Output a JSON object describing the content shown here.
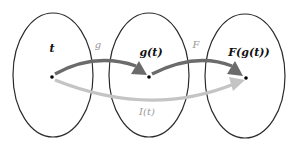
{
  "diagram": {
    "sets": [
      {
        "id": "domain",
        "cx": 53,
        "cy": 75,
        "rx": 40,
        "ry": 62
      },
      {
        "id": "middle",
        "cx": 149,
        "cy": 75,
        "rx": 40,
        "ry": 62
      },
      {
        "id": "codomain",
        "cx": 245,
        "cy": 76,
        "rx": 40,
        "ry": 62
      }
    ],
    "points": [
      {
        "label": "t",
        "x": 52,
        "y": 77
      },
      {
        "label": "g(t)",
        "x": 149,
        "y": 77
      },
      {
        "label": "F(g(t))",
        "x": 246,
        "y": 78
      }
    ],
    "labels": {
      "t": "t",
      "g_t": "g(t)",
      "F_g_t": "F(g(t))",
      "g": "g",
      "F": "F",
      "I_t": "I(t)"
    },
    "arrows": [
      {
        "name": "g",
        "from": "t",
        "to": "g(t)",
        "color": "#6b6b6b"
      },
      {
        "name": "F",
        "from": "g(t)",
        "to": "F(g(t))",
        "color": "#6b6b6b"
      },
      {
        "name": "I(t)",
        "from": "t",
        "to": "F(g(t))",
        "color": "#c4c4c4"
      }
    ],
    "colors": {
      "ellipse_stroke": "#2a2a2a",
      "dark_arrow": "#6b6b6b",
      "light_arrow": "#c4c4c4",
      "point": "#000000",
      "arrow_label": "#9a9a9a"
    }
  }
}
